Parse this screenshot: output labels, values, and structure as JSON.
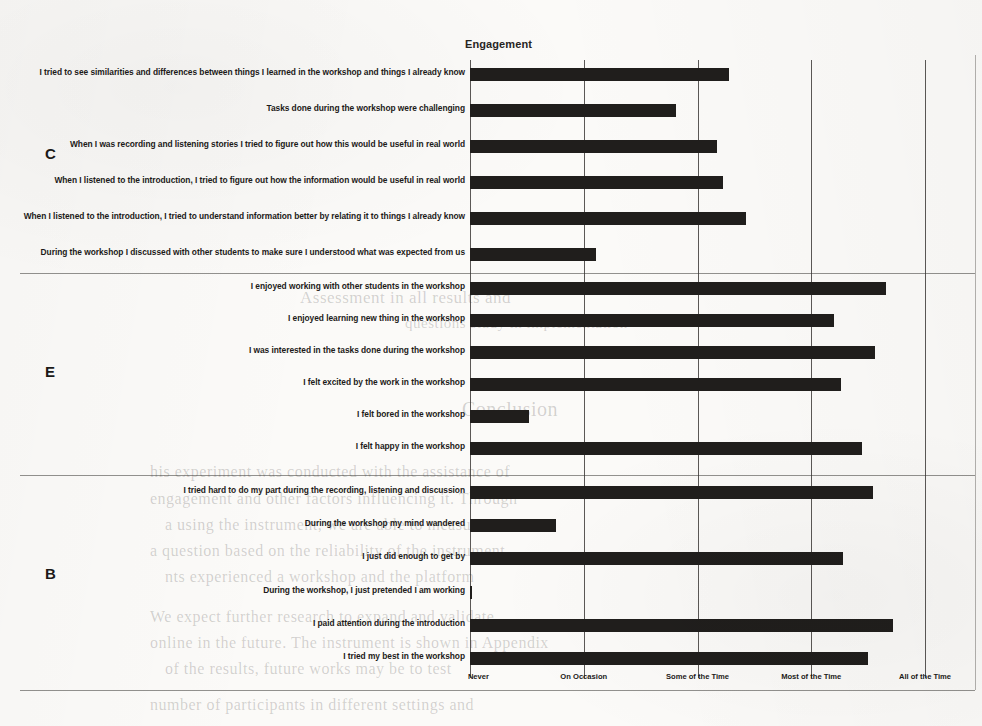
{
  "chart_data": {
    "type": "bar",
    "orientation": "horizontal",
    "title": "Engagement",
    "xlabel": "",
    "ylabel": "",
    "grid": true,
    "legend": "none",
    "xlim": [
      0,
      4
    ],
    "tick_labels": [
      "Never",
      "On Occasion",
      "Some of the Time",
      "Most of the Time",
      "All of the Time"
    ],
    "tick_values": [
      0,
      1,
      2,
      3,
      4
    ],
    "groups": [
      {
        "letter": "C",
        "name": "Cognitive",
        "categories": [
          "I tried to see similarities and differences between things I learned in the workshop and things I already know",
          "Tasks done during the workshop were challenging",
          "When I was recording and listening stories I tried to figure out how this would be useful in real world",
          "When I listened to the introduction, I tried to figure out how the information would be useful in real world",
          "When I listened to the introduction, I tried to understand information better by relating it to things I already know",
          "During the workshop I discussed with other students to make sure I understood what was expected from us"
        ],
        "values": [
          2.28,
          1.81,
          2.17,
          2.22,
          2.43,
          1.11
        ]
      },
      {
        "letter": "E",
        "name": "Emotional",
        "categories": [
          "I enjoyed working with other students in the workshop",
          "I enjoyed learning new thing in the workshop",
          "I was interested in the tasks done during the workshop",
          "I felt excited by the work in the workshop",
          "I felt bored in the workshop",
          "I felt happy in the workshop"
        ],
        "values": [
          3.66,
          3.2,
          3.56,
          3.26,
          0.52,
          3.45
        ]
      },
      {
        "letter": "B",
        "name": "Behavioural",
        "categories": [
          "I tried hard to do my part during the recording, listening and discussion",
          "During the workshop my mind wandered",
          "I just did enough to get by",
          "During the workshop, I just pretended I am working",
          "I paid attention during the introduction",
          "I tried my best in the workshop"
        ],
        "values": [
          3.54,
          0.76,
          3.28,
          0.02,
          3.72,
          3.5
        ]
      }
    ]
  },
  "background_bleed": [
    {
      "text": "Assessment in all results and",
      "x": 300,
      "y": 288,
      "size": 17
    },
    {
      "text": "questions study in implementation",
      "x": 405,
      "y": 315,
      "size": 15
    },
    {
      "text": "Conclusion",
      "x": 462,
      "y": 398,
      "size": 20
    },
    {
      "text": "his experiment was conducted with the assistance of",
      "x": 150,
      "y": 463,
      "size": 16
    },
    {
      "text": "engagement and other factors influencing it. Through",
      "x": 150,
      "y": 490,
      "size": 16
    },
    {
      "text": "a using the instrument, we are able to measure",
      "x": 165,
      "y": 516,
      "size": 16
    },
    {
      "text": "a question based on the reliability of the instrument",
      "x": 150,
      "y": 542,
      "size": 16
    },
    {
      "text": "nts experienced a workshop and the platform",
      "x": 165,
      "y": 568,
      "size": 16
    },
    {
      "text": "We expect further research to expand and validate",
      "x": 150,
      "y": 608,
      "size": 16
    },
    {
      "text": "online in the future. The instrument is shown in Appendix",
      "x": 150,
      "y": 634,
      "size": 16
    },
    {
      "text": "of the results, future works may be to test",
      "x": 165,
      "y": 660,
      "size": 16
    },
    {
      "text": "number of participants in different settings and",
      "x": 150,
      "y": 696,
      "size": 16
    }
  ]
}
